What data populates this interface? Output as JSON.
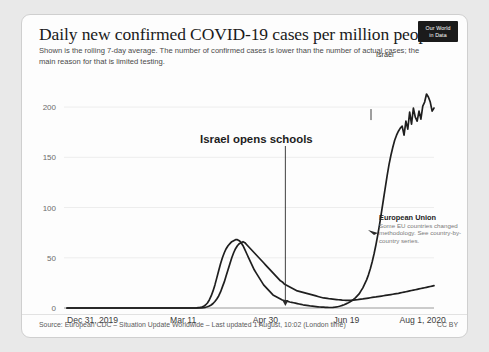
{
  "header": {
    "title": "Daily new confirmed COVID-19 cases per million people",
    "subtitle": "Shown is the rolling 7-day average. The number of confirmed cases is lower than the number of actual cases; the main reason for that is limited testing.",
    "logo_line1": "Our World",
    "logo_line2": "in Data"
  },
  "footer": {
    "source": "Source: European CDC – Situation Update Worldwide – Last updated 1 August, 10:02 (London time)",
    "license": "CC BY"
  },
  "annotations": {
    "schools": "Israel opens schools",
    "israel_label": "Israel",
    "eu_title": "European Union",
    "eu_note": "Some EU countries changed methodology. See country-by-country series."
  },
  "colors": {
    "line": "#1f1f1f",
    "grid": "#ededed",
    "axis_text": "#6b6b6b",
    "card_bg": "#fdfdfd",
    "page_bg": "#e9e9e9",
    "logo_bg": "#1b1b1b"
  },
  "chart_data": {
    "type": "line",
    "title": "Daily new confirmed COVID-19 cases per million people",
    "subtitle": "Shown is the rolling 7-day average. The number of confirmed cases is lower than the number of actual cases; the main reason for that is limited testing.",
    "xlabel": "",
    "ylabel": "",
    "ylim": [
      0,
      215
    ],
    "yticks": [
      0,
      50,
      100,
      150,
      200
    ],
    "ytick_labels": [
      "0",
      "50",
      "100",
      "150",
      "200"
    ],
    "xlim": [
      "Dec 31, 2019",
      "Aug 1, 2020"
    ],
    "xticks": [
      "Dec 31, 2019",
      "Mar 11",
      "Apr 30",
      "Jun 19",
      "Aug 1, 2020"
    ],
    "xtick_positions": [
      0,
      0.33,
      0.555,
      0.775,
      0.955
    ],
    "grid": true,
    "legend": "inline-labels",
    "annotations": [
      {
        "text": "Israel opens schools",
        "target_x": 0.595,
        "target_y": 3
      },
      {
        "text": "Israel",
        "x": 0.93,
        "y": 195
      },
      {
        "text": "European Union",
        "x": 0.95,
        "y": 22
      }
    ],
    "series": [
      {
        "name": "Israel",
        "values": [
          0,
          0,
          0,
          0,
          0,
          0,
          0,
          0,
          0,
          0,
          0,
          0,
          0,
          0,
          0,
          0,
          0,
          0,
          0,
          0,
          0,
          0,
          0,
          0,
          0,
          0,
          0,
          0,
          0,
          0,
          0,
          0,
          0,
          0,
          0,
          0,
          0,
          0,
          0,
          0,
          0,
          0,
          0,
          0,
          0,
          0,
          0,
          0,
          0,
          0,
          0,
          0,
          0,
          0,
          0,
          0,
          0,
          0,
          0,
          0,
          0,
          0,
          0,
          0,
          0,
          0,
          0,
          0,
          0,
          0,
          0.3,
          0.6,
          1,
          1.8,
          3,
          5,
          8,
          12,
          17,
          23,
          30,
          37,
          44,
          50,
          55,
          59,
          62,
          64,
          66,
          67,
          68,
          68,
          67,
          65,
          62,
          58,
          54,
          50,
          46,
          42,
          38,
          35,
          32,
          29,
          26,
          23,
          21,
          19,
          17,
          15,
          13,
          12,
          11,
          10,
          9,
          8,
          7.5,
          7,
          6.5,
          6,
          5.6,
          5.2,
          4.8,
          4.4,
          4,
          3.6,
          3.2,
          2.9,
          2.6,
          2.3,
          2,
          1.8,
          1.6,
          1.4,
          1.2,
          1,
          0.9,
          0.8,
          0.7,
          0.6,
          0.5,
          0.5,
          0.6,
          0.8,
          1.1,
          1.5,
          2,
          2.6,
          3.3,
          4.1,
          5,
          6,
          7.2,
          8.5,
          10,
          12,
          14,
          17,
          20,
          24,
          28,
          33,
          39,
          46,
          54,
          63,
          73,
          84,
          96,
          108,
          120,
          132,
          143,
          152,
          160,
          167,
          172,
          176,
          179,
          181,
          172,
          186,
          178,
          195,
          183,
          199,
          190,
          186,
          196,
          188,
          201,
          205,
          213,
          210,
          205,
          196,
          199
        ],
        "color": "#1f1f1f",
        "peak_spring": 68,
        "trough_value": 0.5,
        "peak_summer": 213,
        "final_value": 199
      },
      {
        "name": "European Union",
        "values": [
          0,
          0,
          0,
          0,
          0,
          0,
          0,
          0,
          0,
          0,
          0,
          0,
          0,
          0,
          0,
          0,
          0,
          0,
          0,
          0,
          0,
          0,
          0,
          0,
          0,
          0,
          0,
          0,
          0,
          0,
          0,
          0,
          0,
          0,
          0,
          0,
          0,
          0,
          0,
          0,
          0,
          0,
          0,
          0,
          0,
          0,
          0,
          0,
          0,
          0,
          0,
          0,
          0,
          0,
          0,
          0,
          0,
          0,
          0,
          0,
          0,
          0,
          0,
          0,
          0,
          0,
          0,
          0,
          0,
          0,
          0,
          0,
          0.2,
          0.4,
          0.7,
          1.2,
          2,
          3,
          4.5,
          6.5,
          9,
          12,
          16,
          21,
          26,
          32,
          38,
          44,
          50,
          55,
          59,
          62,
          64,
          65,
          66,
          65,
          63,
          61,
          59,
          57,
          55,
          53,
          51,
          49,
          47,
          45,
          43,
          41,
          39,
          37,
          35,
          33,
          31,
          29,
          27,
          26,
          24,
          23,
          22,
          21,
          20,
          19,
          18,
          17,
          16.5,
          16,
          15.5,
          15,
          14.5,
          14,
          13.5,
          13,
          12.5,
          12,
          11.5,
          11,
          10.5,
          10,
          9.8,
          9.5,
          9.2,
          9,
          8.8,
          8.6,
          8.4,
          8.2,
          8,
          7.8,
          7.7,
          7.6,
          7.5,
          7.5,
          7.6,
          7.8,
          8,
          8.2,
          8.5,
          8.8,
          9,
          9.3,
          9.6,
          9.9,
          10.2,
          10.5,
          10.8,
          11,
          11.3,
          11.6,
          11.9,
          12.2,
          12.5,
          12.8,
          13.1,
          13.4,
          13.7,
          14,
          14.3,
          14.6,
          15,
          15.4,
          15.8,
          16.2,
          16.6,
          17,
          17.4,
          17.8,
          18.2,
          18.6,
          19,
          19.4,
          19.8,
          20.2,
          20.6,
          21,
          21.4,
          21.8,
          22.2
        ],
        "color": "#1f1f1f",
        "peak_spring": 66,
        "final_value": 22.2
      }
    ]
  }
}
